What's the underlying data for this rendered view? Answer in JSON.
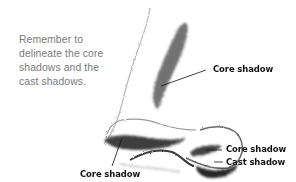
{
  "illustration": {
    "subject": "nose-sketch",
    "intro_text_lines": [
      "Remember to",
      "delineate the core",
      "shadows and the",
      "cast shadows."
    ],
    "labels": {
      "bridge_core": "Core shadow",
      "nostril_core": "Core shadow",
      "nostril_cast": "Cast shadow",
      "tip_core": "Core shadow"
    }
  },
  "colors": {
    "background": "#ffffff",
    "intro_text": "#7a7a7a",
    "label_text": "#111111",
    "shading": "#2a2a2a"
  }
}
